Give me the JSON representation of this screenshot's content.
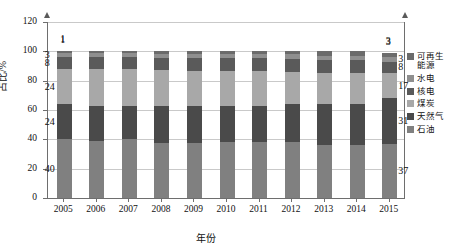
{
  "chart_data": {
    "type": "bar",
    "subtype": "stacked-column",
    "title": "",
    "xlabel": "年份",
    "ylabel": "占比/%",
    "ylim": [
      0,
      120
    ],
    "ytick_step": 20,
    "yticks": [
      "0",
      "20",
      "40",
      "60",
      "80",
      "100",
      "120"
    ],
    "grid": true,
    "legend_position": "right",
    "categories": [
      "2005",
      "2006",
      "2007",
      "2008",
      "2009",
      "2010",
      "2011",
      "2012",
      "2013",
      "2014",
      "2015"
    ],
    "series": [
      {
        "name": "石油",
        "color": "#808080",
        "values": [
          40,
          39,
          40,
          37.5,
          37.5,
          38,
          38,
          38,
          36,
          36,
          37
        ]
      },
      {
        "name": "天然气",
        "color": "#4a4a4a",
        "values": [
          24,
          24,
          23,
          25,
          25,
          24.5,
          24.5,
          26,
          28,
          28,
          31
        ]
      },
      {
        "name": "煤炭",
        "color": "#a8a8a8",
        "values": [
          24,
          25,
          25,
          25,
          24,
          24,
          24,
          22,
          21,
          21,
          17
        ]
      },
      {
        "name": "核电",
        "color": "#5a5a5a",
        "values": [
          8,
          8,
          8,
          8,
          9,
          9,
          9,
          9,
          9,
          9,
          8
        ]
      },
      {
        "name": "水电",
        "color": "#8f8f8f",
        "values": [
          3,
          3,
          3,
          3,
          3,
          3,
          3,
          3,
          3,
          3,
          3
        ]
      },
      {
        "name": "可再生能源",
        "color": "#6b6b6b",
        "values": [
          1,
          1,
          1,
          1.5,
          1.5,
          1.5,
          1.5,
          2,
          3,
          3,
          3
        ]
      }
    ],
    "annotations": {
      "left_labels": [
        {
          "text": "1",
          "value": 1,
          "series": "可再生能源"
        },
        {
          "text": "3",
          "value": 3,
          "series": "水电"
        },
        {
          "text": "8",
          "value": 8,
          "series": "核电"
        },
        {
          "text": "24",
          "value": 24,
          "series": "煤炭"
        },
        {
          "text": "24",
          "value": 24,
          "series": "天然气"
        },
        {
          "text": "40",
          "value": 40,
          "series": "石油"
        }
      ],
      "right_labels": [
        {
          "text": "3",
          "value": 3,
          "series": "可再生能源"
        },
        {
          "text": "3",
          "value": 3,
          "series": "水电"
        },
        {
          "text": "8",
          "value": 8,
          "series": "核电"
        },
        {
          "text": "17",
          "value": 17,
          "series": "煤炭"
        },
        {
          "text": "31",
          "value": 31,
          "series": "天然气"
        },
        {
          "text": "37",
          "value": 37,
          "series": "石油"
        }
      ]
    }
  },
  "legend": {
    "items": [
      {
        "label": "可再生能源",
        "color": "#6b6b6b"
      },
      {
        "label": "水电",
        "color": "#8f8f8f"
      },
      {
        "label": "核电",
        "color": "#5a5a5a"
      },
      {
        "label": "煤炭",
        "color": "#a8a8a8"
      },
      {
        "label": "天然气",
        "color": "#4a4a4a"
      },
      {
        "label": "石油",
        "color": "#808080"
      }
    ]
  },
  "axes": {
    "y_label": "占比/%",
    "x_label": "年份",
    "y_ticks": [
      "0",
      "20",
      "40",
      "60",
      "80",
      "100",
      "120"
    ],
    "x_ticks": [
      "2005",
      "2006",
      "2007",
      "2008",
      "2009",
      "2010",
      "2011",
      "2012",
      "2013",
      "2014",
      "2015"
    ]
  }
}
